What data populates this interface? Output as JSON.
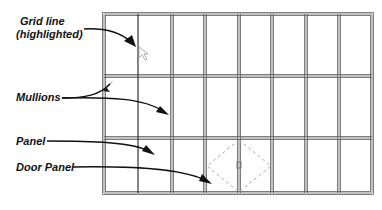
{
  "labels": {
    "grid_line_1": "Grid line",
    "grid_line_2": "(highlighted)",
    "mullions": "Mullions",
    "panel": "Panel",
    "door_panel": "Door Panel"
  },
  "curtain_wall": {
    "x_lines": [
      104,
      138,
      172,
      205,
      239,
      272,
      306,
      339,
      372
    ],
    "y_lines": [
      14,
      76,
      138,
      193
    ],
    "door": {
      "x1": 205,
      "x2": 272,
      "y1": 138,
      "y2": 193
    },
    "line_color": "#555555",
    "mullion_color": "#b8b8b8",
    "door_swing_color": "#aaaaaa"
  },
  "icons": {
    "cursor": "mouse-pointer-icon"
  }
}
